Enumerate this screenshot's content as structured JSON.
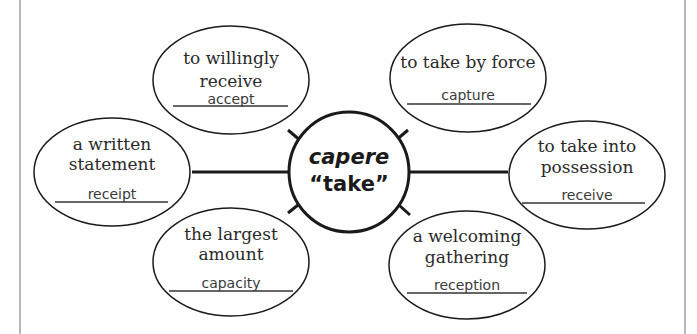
{
  "center": {
    "line1": "capere",
    "line2": "“take”"
  },
  "nodes": [
    {
      "id": "top-left",
      "definition": [
        "to willingly",
        "receive"
      ],
      "answer": "accept"
    },
    {
      "id": "top-right",
      "definition": [
        "to take by force"
      ],
      "answer": "capture"
    },
    {
      "id": "left",
      "definition": [
        "a written",
        "statement"
      ],
      "answer": "receipt"
    },
    {
      "id": "right",
      "definition": [
        "to take into",
        "possession"
      ],
      "answer": "receive"
    },
    {
      "id": "bottom-left",
      "definition": [
        "the largest",
        "amount"
      ],
      "answer": "capacity"
    },
    {
      "id": "bottom-right",
      "definition": [
        "a welcoming",
        "gathering"
      ],
      "answer": "reception"
    }
  ]
}
